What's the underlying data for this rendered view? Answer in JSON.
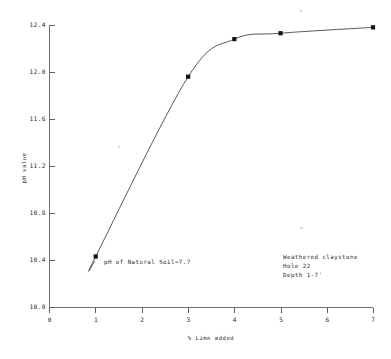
{
  "chart_data": {
    "type": "line",
    "title": "",
    "xlabel": "% Lime added",
    "ylabel": "pH value",
    "xlim": [
      0,
      7
    ],
    "ylim": [
      10.0,
      12.4
    ],
    "grid": false,
    "legend": null,
    "x_ticks": [
      "0",
      "1",
      "2",
      "3",
      "4",
      "5",
      "6",
      "7"
    ],
    "y_ticks": [
      "10.0",
      "10.4",
      "10.8",
      "11.2",
      "11.6",
      "12.0",
      "12.4"
    ],
    "series": [
      {
        "name": "pH vs % Lime added",
        "marker": "square",
        "x": [
          1,
          3,
          4,
          5,
          7
        ],
        "values": [
          10.43,
          11.96,
          12.28,
          12.33,
          12.38
        ]
      }
    ],
    "annotations": [
      {
        "id": "natural-soil-ph",
        "text": "pH of Natural Soil=7.7",
        "x": 1.15,
        "y": 10.43
      },
      {
        "id": "sample-line-1",
        "text": "Weathered claystone",
        "x": 5.0,
        "y": 10.5
      },
      {
        "id": "sample-line-2",
        "text": "Hole 22",
        "x": 5.0,
        "y": 10.42
      },
      {
        "id": "sample-line-3",
        "text": "Depth 1-7'",
        "x": 5.0,
        "y": 10.34
      }
    ]
  },
  "axes": {
    "y_title": "pH value",
    "x_title": "% Lime added"
  },
  "sample_info": {
    "material": "Weathered claystone",
    "hole": "Hole 22",
    "depth": "Depth 1-7'"
  },
  "note": {
    "natural_soil": "pH of Natural Soil=7.7"
  },
  "ticks": {
    "y": [
      "12.4",
      "12.0",
      "11.6",
      "11.2",
      "10.8",
      "10.4",
      "10.0"
    ],
    "x": [
      "0",
      "1",
      "2",
      "3",
      "4",
      "5",
      "6",
      "7"
    ]
  }
}
